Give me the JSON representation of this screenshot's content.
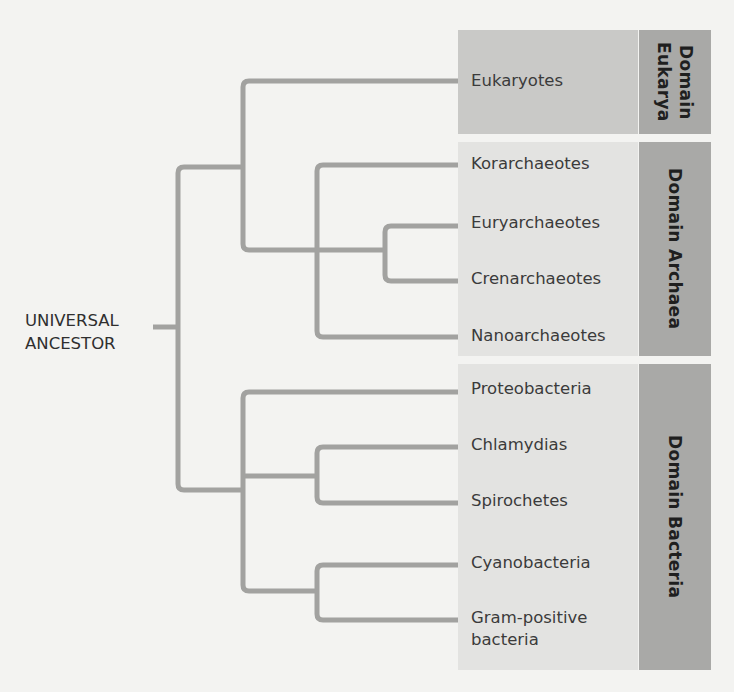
{
  "diagram": {
    "type": "phylogenetic-tree",
    "root_label_line1": "UNIVERSAL",
    "root_label_line2": "ANCESTOR",
    "colors": {
      "background": "#f3f3f1",
      "branch": "#a2a2a0",
      "eukarya_box": "#c9c9c7",
      "archaea_bacteria_box": "#e3e3e1",
      "domain_tab": "#a9a9a7",
      "taxon_text": "#3b3b3b",
      "domain_text": "#1f1f1f"
    },
    "domains": [
      {
        "name": "Domain Eukarya",
        "label_line1": "Domain",
        "label_line2": "Eukarya",
        "taxa": [
          "Eukaryotes"
        ]
      },
      {
        "name": "Domain Archaea",
        "label": "Domain Archaea",
        "taxa": [
          "Korarchaeotes",
          "Euryarchaeotes",
          "Crenarchaeotes",
          "Nanoarchaeotes"
        ]
      },
      {
        "name": "Domain Bacteria",
        "label": "Domain Bacteria",
        "taxa": [
          "Proteobacteria",
          "Chlamydias",
          "Spirochetes",
          "Cyanobacteria",
          "Gram-positive bacteria"
        ],
        "gram_positive_line1": "Gram-positive",
        "gram_positive_line2": "bacteria"
      }
    ],
    "topology": "(((Eukaryotes),((Korarchaeotes,(Euryarchaeotes,Crenarchaeotes)),Nanoarchaeotes)),(Proteobacteria,(Chlamydias,Spirochetes),(Cyanobacteria,Gram-positive bacteria)))"
  }
}
